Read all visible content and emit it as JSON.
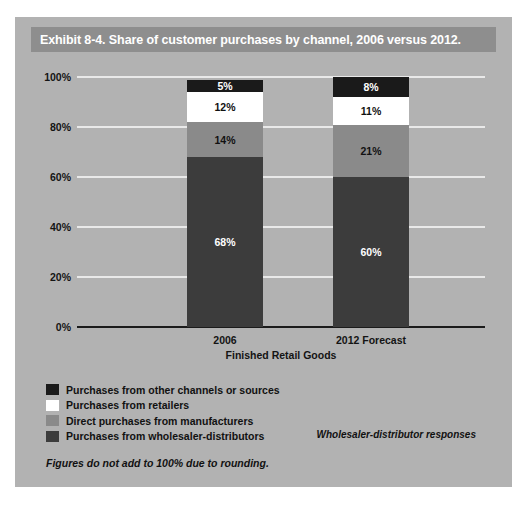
{
  "exhibit": {
    "title": "Exhibit 8-4. Share of customer purchases by channel, 2006 versus 2012.",
    "footnote": "Figures do not add to 100% due to rounding.",
    "source_note": "Wholesaler-distributor responses"
  },
  "chart_data": {
    "type": "bar",
    "stacked": true,
    "title": "Exhibit 8-4. Share of customer purchases by channel, 2006 versus 2012.",
    "xlabel": "Finished Retail Goods",
    "ylabel": "",
    "categories": [
      "2006",
      "2012 Forecast"
    ],
    "ylim": [
      0,
      100
    ],
    "ytick_labels": [
      "0%",
      "20%",
      "40%",
      "60%",
      "80%",
      "100%"
    ],
    "ytick_values": [
      0,
      20,
      40,
      60,
      80,
      100
    ],
    "grid": true,
    "legend_position": "below",
    "series": [
      {
        "name": "Purchases from wholesaler-distributors",
        "color": "#3c3c3c",
        "text_color": "#ffffff",
        "values": [
          68,
          60
        ],
        "labels": [
          "68%",
          "60%"
        ]
      },
      {
        "name": "Direct purchases from manufacturers",
        "color": "#8a8a8a",
        "text_color": "#111111",
        "values": [
          14,
          21
        ],
        "labels": [
          "14%",
          "21%"
        ]
      },
      {
        "name": "Purchases from retailers",
        "color": "#ffffff",
        "text_color": "#111111",
        "values": [
          12,
          11
        ],
        "labels": [
          "12%",
          "11%"
        ]
      },
      {
        "name": "Purchases from other channels or sources",
        "color": "#1a1a1a",
        "text_color": "#ffffff",
        "values": [
          5,
          8
        ],
        "labels": [
          "5%",
          "8%"
        ]
      }
    ],
    "legend_order": [
      "Purchases from other channels or sources",
      "Purchases from retailers",
      "Direct purchases from manufacturers",
      "Purchases from wholesaler-distributors"
    ]
  },
  "colors": {
    "panel_background": "#b2b2b2",
    "title_bar": "#8e8e8e",
    "title_text": "#ffffff",
    "gridline": "#e9e9e9",
    "axis_line": "#1b1b1b"
  }
}
